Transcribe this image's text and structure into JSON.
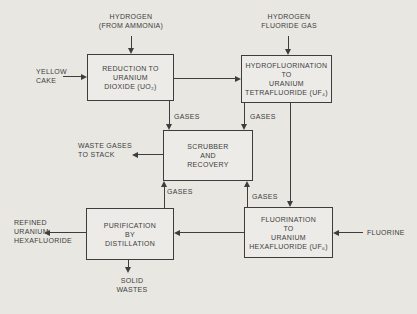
{
  "diagram": {
    "colors": {
      "background": "#e8e7e2",
      "ink": "#3d3d3d",
      "box_fill": "#ecebe7"
    },
    "boxes": {
      "reduction": {
        "lines": [
          "REDUCTION TO",
          "URANIUM",
          "DIOXIDE (UO₂)"
        ]
      },
      "hydrofluorination": {
        "lines": [
          "HYDROFLUORINATION",
          "TO",
          "URANIUM",
          "TETRAFLUORIDE (UF₄)"
        ]
      },
      "scrubber": {
        "lines": [
          "SCRUBBER",
          "AND",
          "RECOVERY"
        ]
      },
      "purification": {
        "lines": [
          "PURIFICATION",
          "BY",
          "DISTILLATION"
        ]
      },
      "fluorination": {
        "lines": [
          "FLUORINATION",
          "TO",
          "URANIUM",
          "HEXAFLUORIDE (UF₆)"
        ]
      }
    },
    "labels": {
      "hydrogen_ammonia": {
        "lines": [
          "HYDROGEN",
          "(FROM AMMONIA)"
        ]
      },
      "hydrogen_fluoride": {
        "lines": [
          "HYDROGEN",
          "FLUORIDE GAS"
        ]
      },
      "yellow_cake": {
        "lines": [
          "YELLOW",
          "CAKE"
        ]
      },
      "waste_gases": {
        "lines": [
          "WASTE GASES",
          "TO STACK"
        ]
      },
      "refined_uf6": {
        "lines": [
          "REFINED",
          "URANIUM",
          "HEXAFLUORIDE"
        ]
      },
      "solid_wastes": {
        "lines": [
          "SOLID",
          "WASTES"
        ]
      },
      "fluorine": {
        "text": "FLUORINE"
      },
      "gases_reduction": {
        "text": "GASES"
      },
      "gases_hydrofluorination": {
        "text": "GASES"
      },
      "gases_purification": {
        "text": "GASES"
      },
      "gases_fluorination": {
        "text": "GASES"
      }
    }
  }
}
